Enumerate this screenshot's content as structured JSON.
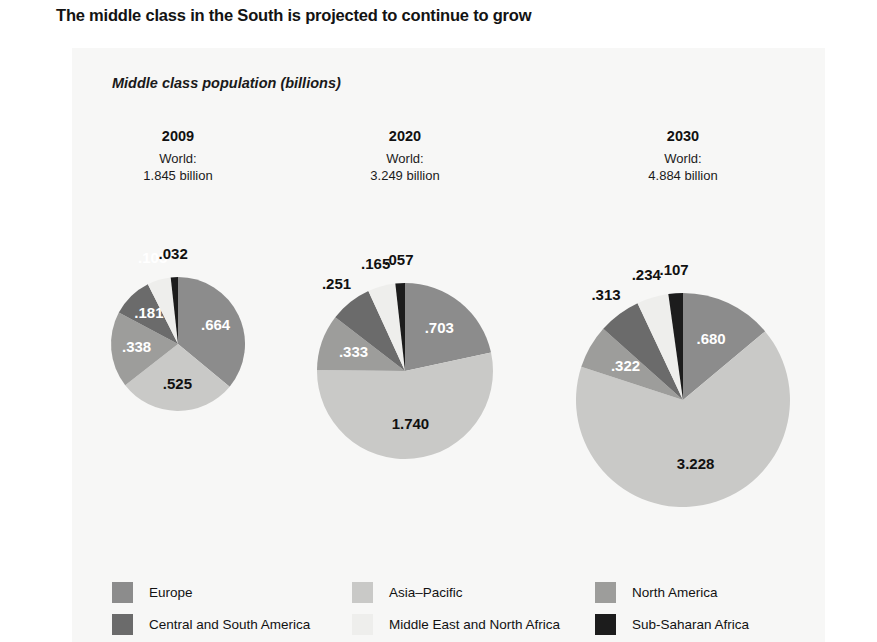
{
  "title": "The middle class in the South is projected to continue to grow",
  "axis_label": "Middle class population (billions)",
  "legend": {
    "rows": [
      [
        {
          "label": "Europe",
          "color": "#8c8c8c"
        },
        {
          "label": "Asia–Pacific",
          "color": "#c9c9c7"
        },
        {
          "label": "North America",
          "color": "#9d9d9b"
        }
      ],
      [
        {
          "label": "Central and South America",
          "color": "#6b6b6b"
        },
        {
          "label": "Middle East and North Africa",
          "color": "#eeeeec"
        },
        {
          "label": "Sub-Saharan Africa",
          "color": "#1c1c1c"
        }
      ]
    ]
  },
  "chart_data": {
    "type": "pie",
    "title": "The middle class in the South is projected to continue to grow",
    "ylabel": "Middle class population (billions)",
    "units": "billions",
    "legend_position": "bottom",
    "grid": false,
    "colors": {
      "Europe": "#8c8c8c",
      "Asia-Pacific": "#c9c9c7",
      "North America": "#9d9d9b",
      "Central and South America": "#6b6b6b",
      "Middle East and North Africa": "#eeeeec",
      "Sub-Saharan Africa": "#1c1c1c"
    },
    "categories": [
      "Europe",
      "Asia-Pacific",
      "North America",
      "Central and South America",
      "Middle East and North Africa",
      "Sub-Saharan Africa"
    ],
    "pies": [
      {
        "year": "2009",
        "world_line1": "World:",
        "world_line2": "1.845 billion",
        "total": 1.845,
        "center_x": 178,
        "center_y": 344,
        "radius": 67,
        "values": [
          0.664,
          0.525,
          0.338,
          0.181,
          0.105,
          0.032
        ],
        "labels": [
          ".664",
          ".525",
          ".338",
          ".181",
          ".105",
          ".032"
        ],
        "label_styles": [
          {
            "inside": true,
            "color": "#ffffff",
            "size": 15
          },
          {
            "inside": true,
            "color": "#111111",
            "size": 15
          },
          {
            "inside": true,
            "color": "#ffffff",
            "size": 15
          },
          {
            "inside": true,
            "color": "#ffffff",
            "size": 15
          },
          {
            "inside": false,
            "color": "#ffffff",
            "size": 15
          },
          {
            "inside": false,
            "color": "#111111",
            "size": 15
          }
        ]
      },
      {
        "year": "2020",
        "world_line1": "World:",
        "world_line2": "3.249 billion",
        "total": 3.249,
        "center_x": 405,
        "center_y": 371,
        "radius": 88,
        "values": [
          0.703,
          1.74,
          0.333,
          0.251,
          0.165,
          0.057
        ],
        "labels": [
          ".703",
          "1.740",
          ".333",
          ".251",
          ".165",
          ".057"
        ],
        "label_styles": [
          {
            "inside": true,
            "color": "#ffffff",
            "size": 15
          },
          {
            "inside": true,
            "color": "#111111",
            "size": 15
          },
          {
            "inside": true,
            "color": "#ffffff",
            "size": 15
          },
          {
            "inside": false,
            "color": "#111111",
            "size": 15
          },
          {
            "inside": false,
            "color": "#111111",
            "size": 15
          },
          {
            "inside": false,
            "color": "#111111",
            "size": 15
          }
        ]
      },
      {
        "year": "2030",
        "world_line1": "World:",
        "world_line2": "4.884 billion",
        "total": 4.884,
        "center_x": 683,
        "center_y": 400,
        "radius": 107,
        "values": [
          0.68,
          3.228,
          0.322,
          0.313,
          0.234,
          0.107
        ],
        "labels": [
          ".680",
          "3.228",
          ".322",
          ".313",
          ".234",
          ".107"
        ],
        "label_styles": [
          {
            "inside": true,
            "color": "#ffffff",
            "size": 15
          },
          {
            "inside": true,
            "color": "#111111",
            "size": 15
          },
          {
            "inside": true,
            "color": "#ffffff",
            "size": 15
          },
          {
            "inside": false,
            "color": "#111111",
            "size": 15
          },
          {
            "inside": false,
            "color": "#111111",
            "size": 15
          },
          {
            "inside": false,
            "color": "#111111",
            "size": 15
          }
        ]
      }
    ]
  }
}
